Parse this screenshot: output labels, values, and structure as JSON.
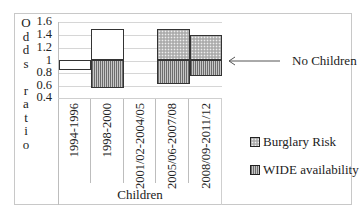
{
  "chart_data": {
    "type": "bar",
    "subtype": "floating-range-bar (deviation from odds ratio 1.0)",
    "title": "",
    "ylabel": "Odds ratio",
    "xlabel": "Children",
    "ylim": [
      0.4,
      1.6
    ],
    "yticks": [
      "1.6",
      "1.4",
      "1.2",
      "1",
      "0.8",
      "0.6",
      "0.4"
    ],
    "grid": true,
    "categories": [
      "1994-1996",
      "1998-2000",
      "2001/02-2004/05",
      "2005/06-2007/08",
      "2008/09-2011/12"
    ],
    "series": [
      {
        "name": "Burglary Risk",
        "pattern": "dotted",
        "values": [
          0.84,
          1.49,
          null,
          1.49,
          1.4
        ]
      },
      {
        "name": "WIDE availability",
        "pattern": "vertical-hatch",
        "values": [
          null,
          0.56,
          null,
          0.62,
          0.75
        ]
      }
    ],
    "reference_line": {
      "value": 1.0,
      "label": "No Children"
    },
    "legend_position": "right"
  },
  "ylabel_chars": [
    "O",
    "d",
    "d",
    "s",
    "",
    "r",
    "a",
    "t",
    "i",
    "o"
  ],
  "annotation": {
    "label": "No Children"
  },
  "legend": [
    {
      "label": "Burglary Risk"
    },
    {
      "label": "WIDE availability"
    }
  ]
}
